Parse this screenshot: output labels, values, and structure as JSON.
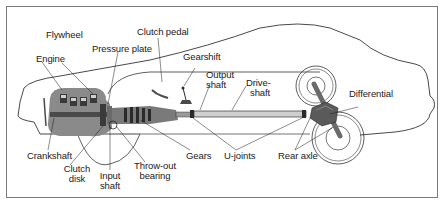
{
  "diagram": {
    "colors": {
      "outline": "#1a1a1a",
      "engine_fill": "#8a8a8a",
      "component_fill": "#5a5a5a",
      "shaft_fill": "#c8c8c8",
      "frame": "#7a7a7a"
    },
    "labels": {
      "flywheel": "Flywheel",
      "clutch_pedal": "Clutch pedal",
      "pressure_plate": "Pressure plate",
      "engine": "Engine",
      "gearshift": "Gearshift",
      "output_shaft_1": "Output",
      "output_shaft_2": "shaft",
      "driveshaft_1": "Drive-",
      "driveshaft_2": "shaft",
      "differential": "Differential",
      "crankshaft": "Crankshaft",
      "clutch_disk_1": "Clutch",
      "clutch_disk_2": "disk",
      "input_shaft_1": "Input",
      "input_shaft_2": "shaft",
      "throwout_bearing_1": "Throw-out",
      "throwout_bearing_2": "bearing",
      "gears": "Gears",
      "u_joints": "U-joints",
      "rear_axle": "Rear axle"
    }
  }
}
